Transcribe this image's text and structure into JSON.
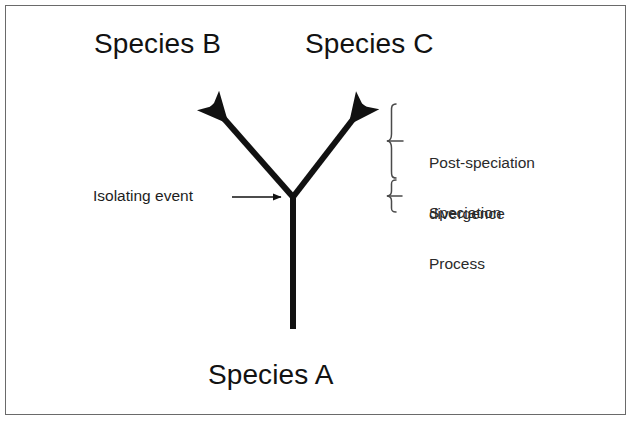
{
  "figure": {
    "background_color": "#ffffff",
    "border_color": "#6a6a6a"
  },
  "labels": {
    "species_b": "Species B",
    "species_c": "Species C",
    "species_a": "Species A",
    "isolating_event": "Isolating event",
    "post_speciation_line1": "Post-speciation",
    "post_speciation_line2": "divergence",
    "speciation_line1": "Speciation",
    "speciation_line2": "Process"
  },
  "icons": {
    "branch_arrow_left": "arrow-up-left-icon",
    "branch_arrow_right": "arrow-up-right-icon",
    "pointer_arrow": "arrow-right-icon",
    "brace_upper": "curly-brace-icon",
    "brace_lower": "curly-brace-icon"
  },
  "diagram_data": {
    "type": "phylogenetic-tree",
    "stroke_color": "#111111",
    "branch_stroke_width": 6,
    "annotation_stroke_width": 1.4,
    "junction": {
      "x": 293,
      "y": 197,
      "name": "isolating-event-node"
    },
    "trunk": {
      "x": 293,
      "y_top": 197,
      "y_bottom": 329,
      "label": "Species A"
    },
    "branches": [
      {
        "name": "branch-species-b",
        "from_x": 293,
        "from_y": 197,
        "to_x": 207,
        "to_y": 99,
        "label": "Species B"
      },
      {
        "name": "branch-species-c",
        "from_x": 293,
        "from_y": 197,
        "to_x": 369,
        "to_y": 99,
        "label": "Species C"
      }
    ],
    "pointer": {
      "name": "isolating-event-pointer",
      "from_x": 232,
      "from_y": 197,
      "to_x": 288,
      "to_y": 197
    },
    "brackets": [
      {
        "name": "bracket-post-speciation-divergence",
        "x": 392,
        "y_top": 104,
        "y_bottom": 178,
        "tip_y": 141,
        "label": "Post-speciation divergence"
      },
      {
        "name": "bracket-speciation-process",
        "x": 392,
        "y_top": 180,
        "y_bottom": 212,
        "tip_y": 196,
        "label": "Speciation Process"
      }
    ]
  }
}
